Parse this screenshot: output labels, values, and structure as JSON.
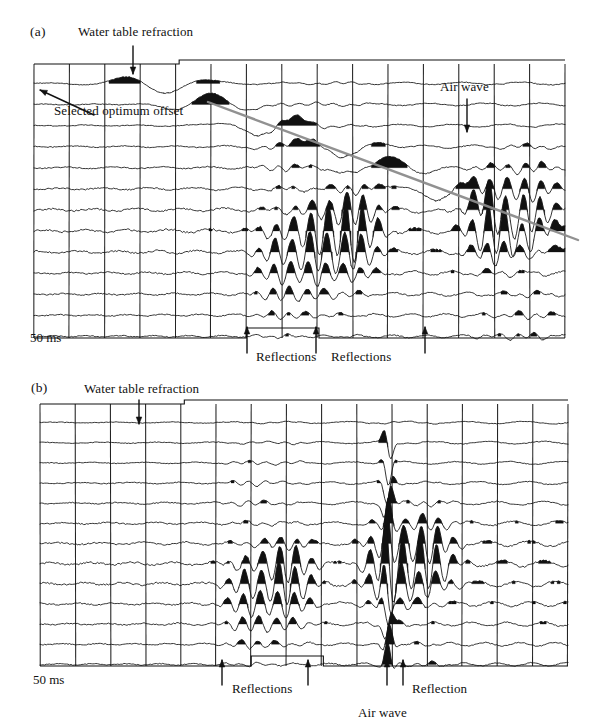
{
  "figure": {
    "background": "#ffffff",
    "ink": "#111111",
    "airwave_line_color": "#8c8c8c"
  },
  "panels": [
    {
      "id": "a",
      "label": "(a)",
      "label_pos": {
        "x": 30,
        "y": 32
      },
      "frame": {
        "x": 34,
        "y": 64,
        "w": 531,
        "h": 274
      },
      "traces": 13,
      "timing_lines": 16,
      "scalebar": {
        "text": "50 ms",
        "x": 30,
        "y": 335
      },
      "annotations": [
        {
          "name": "water-table-refraction",
          "text": "Water table refraction",
          "text_x": 78,
          "text_y": 34,
          "arrow": {
            "x1": 133,
            "y1": 46,
            "x2": 133,
            "y2": 74
          },
          "type": "down-arrow"
        },
        {
          "name": "selected-optimum-offset",
          "text": "Selected optimum offset",
          "text_x": 54,
          "text_y": 112,
          "arrow": {
            "x1": 94,
            "y1": 115,
            "x2": 40,
            "y2": 90
          },
          "type": "pointer-arrow"
        },
        {
          "name": "air-wave",
          "text": "Air wave",
          "text_x": 443,
          "text_y": 88,
          "arrow": {
            "x1": 467,
            "y1": 99,
            "x2": 467,
            "y2": 132
          },
          "type": "down-arrow"
        },
        {
          "name": "reflections-left",
          "text": "Reflections",
          "text_x": 256,
          "text_y": 358,
          "arrow": {
            "x1": 247,
            "y1": 353,
            "x2": 247,
            "y2": 327
          },
          "type": "up-arrow"
        },
        {
          "name": "reflections-right",
          "text": "Reflections",
          "text_x": 331,
          "text_y": 358,
          "arrow": {
            "x1": 316,
            "y1": 353,
            "x2": 316,
            "y2": 327
          },
          "type": "up-arrow"
        },
        {
          "name": "reflections-far-right",
          "text": "",
          "text_x": 0,
          "text_y": 0,
          "arrow": {
            "x1": 425,
            "y1": 353,
            "x2": 425,
            "y2": 327
          },
          "type": "up-arrow"
        }
      ],
      "airwave_line": {
        "x1": 208,
        "y1": 102,
        "x2": 578,
        "y2": 240
      }
    },
    {
      "id": "b",
      "label": "(b)",
      "label_pos": {
        "x": 33,
        "y": 388
      },
      "frame": {
        "x": 40,
        "y": 404,
        "w": 528,
        "h": 262
      },
      "traces": 13,
      "timing_lines": 16,
      "scalebar": {
        "text": "50 ms",
        "x": 33,
        "y": 678
      },
      "annotations": [
        {
          "name": "water-table-refraction",
          "text": "Water table refraction",
          "text_x": 84,
          "text_y": 390,
          "arrow": {
            "x1": 139,
            "y1": 400,
            "x2": 139,
            "y2": 424
          },
          "type": "down-arrow"
        },
        {
          "name": "reflections-left",
          "text": "Reflections",
          "text_x": 232,
          "text_y": 690,
          "arrow": {
            "x1": 222,
            "y1": 685,
            "x2": 222,
            "y2": 660
          },
          "type": "up-arrow"
        },
        {
          "name": "reflections-right-arrow",
          "text": "",
          "text_x": 0,
          "text_y": 0,
          "arrow": {
            "x1": 308,
            "y1": 685,
            "x2": 308,
            "y2": 660
          },
          "type": "up-arrow"
        },
        {
          "name": "air-wave",
          "text": "Air wave",
          "text_x": 358,
          "text_y": 714,
          "arrow": {
            "x1": 387,
            "y1": 685,
            "x2": 387,
            "y2": 660
          },
          "type": "up-arrow"
        },
        {
          "name": "reflection",
          "text": "Reflection",
          "text_x": 412,
          "text_y": 690,
          "arrow": {
            "x1": 403,
            "y1": 685,
            "x2": 403,
            "y2": 660
          },
          "type": "up-arrow"
        }
      ],
      "airwave_column": {
        "x": 388,
        "y_top": 430,
        "y_bottom": 660
      }
    }
  ],
  "chart_data": {
    "type": "line",
    "xlabel": "Distance along profile (trace number)",
    "ylabel": "Two-way travel time",
    "time_scale_label": "50 ms",
    "grid": true,
    "legend": "none",
    "panels": [
      {
        "name": "(a)",
        "n_traces": 13,
        "n_timing_lines": 16,
        "features": [
          {
            "feature": "Water table refraction",
            "trace_index": 0,
            "timing_line": 3
          },
          {
            "feature": "Selected optimum offset",
            "trace_index": 0,
            "timing_line": 0
          },
          {
            "feature": "Air wave",
            "trace_index": 2,
            "timing_line": 12,
            "character": "linear moveout, gray guide line"
          },
          {
            "feature": "Reflections",
            "trace_index": 12,
            "timing_line": 6
          },
          {
            "feature": "Reflections",
            "trace_index": 12,
            "timing_line": 8
          },
          {
            "feature": "Reflections",
            "trace_index": 12,
            "timing_line": 11
          }
        ],
        "amplitude_envelope": [
          0.08,
          0.1,
          0.14,
          0.22,
          0.35,
          0.55,
          0.85,
          1.0,
          0.8,
          0.55,
          0.4,
          0.3,
          0.22
        ],
        "high_amplitude_columns": [
          7,
          8,
          9,
          13,
          14
        ]
      },
      {
        "name": "(b)",
        "n_traces": 13,
        "n_timing_lines": 16,
        "features": [
          {
            "feature": "Water table refraction",
            "trace_index": 0,
            "timing_line": 3
          },
          {
            "feature": "Reflections",
            "trace_index": 12,
            "timing_line": 5
          },
          {
            "feature": "Reflections",
            "trace_index": 12,
            "timing_line": 8
          },
          {
            "feature": "Air wave",
            "trace_index": 12,
            "timing_line": 10,
            "character": "steep near-vertical high amplitude column"
          },
          {
            "feature": "Reflection",
            "trace_index": 12,
            "timing_line": 11
          }
        ],
        "amplitude_envelope": [
          0.06,
          0.09,
          0.13,
          0.2,
          0.32,
          0.5,
          0.78,
          1.0,
          0.86,
          0.62,
          0.45,
          0.33,
          0.24
        ],
        "high_amplitude_columns": [
          6,
          7,
          10,
          11
        ]
      }
    ]
  }
}
